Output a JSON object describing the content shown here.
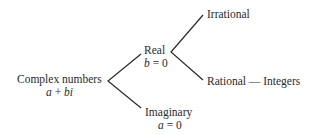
{
  "diagram": {
    "type": "tree",
    "root": {
      "label": "Complex numbers",
      "formula": {
        "a": "a",
        "op": " + ",
        "b": "bi"
      }
    },
    "branches": {
      "real": {
        "label": "Real",
        "condition": {
          "var": "b",
          "rest": " = 0"
        },
        "children": {
          "irrational": {
            "label": "Irrational"
          },
          "rational": {
            "label": "Rational — Integers"
          }
        }
      },
      "imaginary": {
        "label": "Imaginary",
        "condition": {
          "var": "a",
          "rest": " = 0"
        }
      }
    },
    "colors": {
      "ink": "#2a2a2a",
      "background": "#ffffff"
    }
  }
}
